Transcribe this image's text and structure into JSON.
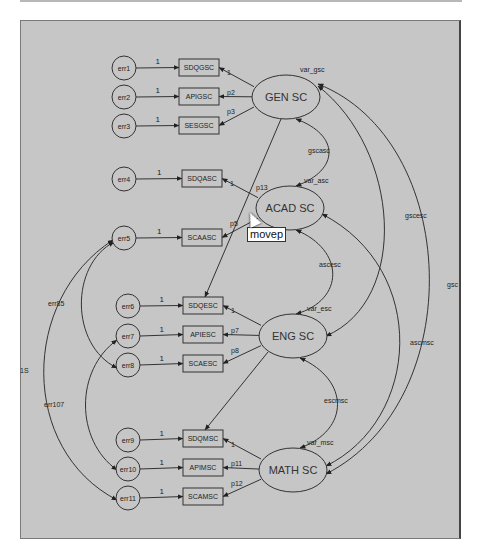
{
  "diagram": {
    "error_terms": [
      {
        "id": "err1",
        "label": "err1",
        "x": 124,
        "y": 68
      },
      {
        "id": "err2",
        "label": "err2",
        "x": 124,
        "y": 97
      },
      {
        "id": "err3",
        "label": "err3",
        "x": 124,
        "y": 126
      },
      {
        "id": "err4",
        "label": "err4",
        "x": 124,
        "y": 179
      },
      {
        "id": "err5",
        "label": "err5",
        "x": 124,
        "y": 238
      },
      {
        "id": "err6",
        "label": "err6",
        "x": 128,
        "y": 306
      },
      {
        "id": "err7",
        "label": "err7",
        "x": 128,
        "y": 336
      },
      {
        "id": "err8",
        "label": "err8",
        "x": 128,
        "y": 365
      },
      {
        "id": "err9",
        "label": "err9",
        "x": 128,
        "y": 440
      },
      {
        "id": "err10",
        "label": "err10",
        "x": 128,
        "y": 469
      },
      {
        "id": "err11",
        "label": "err11",
        "x": 128,
        "y": 498
      }
    ],
    "observed": [
      {
        "id": "SDQGSC",
        "label": "SDQGSC",
        "x": 179,
        "y": 59,
        "factor": "GEN SC",
        "loading": "1"
      },
      {
        "id": "APIGSC",
        "label": "APIGSC",
        "x": 179,
        "y": 88,
        "factor": "GEN SC",
        "loading": "p2"
      },
      {
        "id": "SESGSC",
        "label": "SESGSC",
        "x": 179,
        "y": 117,
        "factor": "GEN SC",
        "loading": "p3"
      },
      {
        "id": "SDQASC",
        "label": "SDQASC",
        "x": 182,
        "y": 170,
        "factor": "ACAD SC",
        "loading": "1"
      },
      {
        "id": "SCAASC",
        "label": "SCAASC",
        "x": 182,
        "y": 229,
        "factor": "ACAD SC",
        "loading": "p5"
      },
      {
        "id": "SDQESC",
        "label": "SDQESC",
        "x": 183,
        "y": 297,
        "factor": "ENG SC",
        "loading": "1"
      },
      {
        "id": "APIESC",
        "label": "APIESC",
        "x": 183,
        "y": 326,
        "factor": "ENG SC",
        "loading": "p7"
      },
      {
        "id": "SCAESC",
        "label": "SCAESC",
        "x": 183,
        "y": 355,
        "factor": "ENG SC",
        "loading": "p8"
      },
      {
        "id": "SDQMSC",
        "label": "SDQMSC",
        "x": 183,
        "y": 430,
        "factor": "MATH SC",
        "loading": "1"
      },
      {
        "id": "APIMSC",
        "label": "APIMSC",
        "x": 183,
        "y": 459,
        "factor": "MATH SC",
        "loading": "p11"
      },
      {
        "id": "SCAMSC",
        "label": "SCAMSC",
        "x": 183,
        "y": 488,
        "factor": "MATH SC",
        "loading": "p12"
      }
    ],
    "latent": [
      {
        "id": "GEN SC",
        "label": "GEN SC",
        "cx": 286,
        "cy": 97,
        "variance": "var_gsc"
      },
      {
        "id": "ACAD SC",
        "label": "ACAD SC",
        "cx": 290,
        "cy": 208,
        "variance": "var_asc"
      },
      {
        "id": "ENG SC",
        "label": "ENG SC",
        "cx": 293,
        "cy": 336,
        "variance": "var_esc"
      },
      {
        "id": "MATH SC",
        "label": "MATH SC",
        "cx": 293,
        "cy": 470,
        "variance": "var_msc"
      }
    ],
    "error_weight": "1",
    "covariances": [
      {
        "label": "gscasc",
        "between": [
          "GEN SC",
          "ACAD SC"
        ]
      },
      {
        "label": "ascesc",
        "between": [
          "ACAD SC",
          "ENG SC"
        ]
      },
      {
        "label": "escmsc",
        "between": [
          "ENG SC",
          "MATH SC"
        ]
      },
      {
        "label": "gscesc",
        "between": [
          "GEN SC",
          "ENG SC"
        ]
      },
      {
        "label": "ascmsc",
        "between": [
          "ACAD SC",
          "MATH SC"
        ]
      },
      {
        "label": "gsc",
        "between": [
          "GEN SC",
          "MATH SC"
        ]
      },
      {
        "label": "err85",
        "between": [
          "err5",
          "err8"
        ]
      },
      {
        "label": "err107",
        "between": [
          "err7",
          "err10"
        ]
      },
      {
        "label": "1S",
        "between": [
          "err5",
          "err11"
        ]
      }
    ],
    "cross_loadings": [
      {
        "label": "p13",
        "from": "GEN SC",
        "to": "SDQESC"
      },
      {
        "label": "",
        "from": "ENG SC",
        "to": "SDQMSC"
      }
    ],
    "tooltip": "movep"
  }
}
